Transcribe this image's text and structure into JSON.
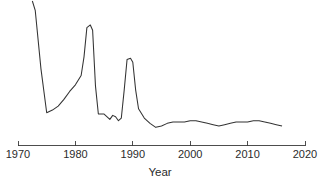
{
  "chart_data": {
    "type": "line",
    "title": "",
    "subtitle": "",
    "xlabel": "Year",
    "ylabel": "",
    "xlim": [
      1970,
      2020
    ],
    "ylim": [
      0,
      100
    ],
    "grid": false,
    "legend": null,
    "xticks": [
      "1970",
      "1980",
      "1990",
      "2000",
      "2010",
      "2020"
    ],
    "xtick_values": [
      1970,
      1980,
      1990,
      2000,
      2010,
      2020
    ],
    "yticks": [],
    "series": [
      {
        "name": "value",
        "color": "#333333",
        "x": [
          1972.5,
          1973,
          1974,
          1975,
          1976,
          1977,
          1978,
          1979,
          1980,
          1981,
          1981.5,
          1982,
          1982.6,
          1983,
          1983.5,
          1984,
          1985,
          1986,
          1986.5,
          1987,
          1987.5,
          1988,
          1988.5,
          1989,
          1989.6,
          1990,
          1990.5,
          1991,
          1992,
          1993,
          1994,
          1995,
          1996,
          1997,
          1998,
          1999,
          2000,
          2001,
          2002,
          2003,
          2004,
          2005,
          2006,
          2007,
          2008,
          2009,
          2010,
          2011,
          2012,
          2013,
          2014,
          2015,
          2016
        ],
        "values": [
          100,
          93,
          49,
          16,
          18,
          21,
          26,
          32,
          37,
          44,
          58,
          80,
          82,
          78,
          36,
          15,
          15,
          11,
          14,
          13,
          10,
          12,
          33,
          56,
          57,
          54,
          33,
          19,
          12,
          8,
          5,
          6,
          8,
          9,
          9,
          9,
          10,
          10,
          9,
          8,
          7,
          6,
          7,
          8,
          9,
          9,
          9,
          10,
          10,
          9,
          8,
          7,
          6
        ]
      }
    ]
  },
  "axis": {
    "x_title": "Year"
  }
}
